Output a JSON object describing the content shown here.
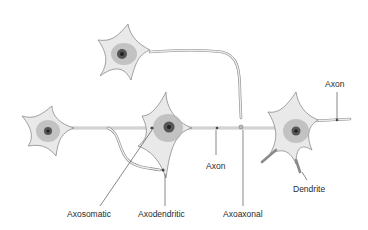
{
  "diagram": {
    "type": "neuron-synapse-types",
    "labels": {
      "axon_top": "Axon",
      "axon_middle": "Axon",
      "dendrite": "Dendrite",
      "axosomatic": "Axosomatic",
      "axodendritic": "Axodendritic",
      "axoaxonal": "Axoaxonal"
    },
    "neurons": [
      {
        "name": "top-neuron",
        "cx": 127,
        "cy": 55
      },
      {
        "name": "left-neuron",
        "cx": 49,
        "cy": 131
      },
      {
        "name": "middle-neuron",
        "cx": 168,
        "cy": 128
      },
      {
        "name": "right-neuron",
        "cx": 295,
        "cy": 131
      }
    ],
    "colors": {
      "cell_fill": "#e9e9e9",
      "outline": "#8a8a8a",
      "nucleus": "#333333",
      "text": "#2a2a2a"
    }
  }
}
